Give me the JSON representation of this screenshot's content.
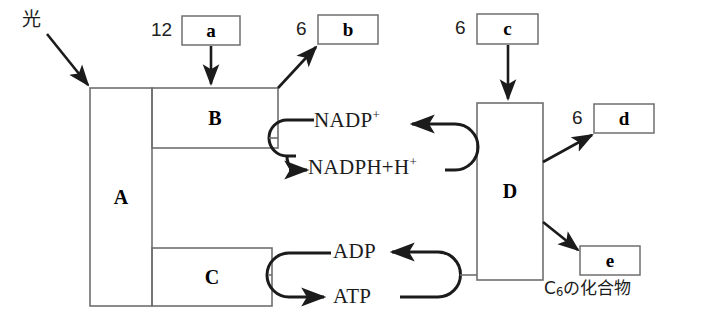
{
  "figure": {
    "background_color": "#ffffff",
    "line_color": "#333333",
    "arrow_color": "#1b1b1b"
  },
  "light": {
    "label": "光"
  },
  "process_boxes": [
    {
      "id": "A",
      "label": "A"
    },
    {
      "id": "B",
      "label": "B"
    },
    {
      "id": "C",
      "label": "C"
    },
    {
      "id": "D",
      "label": "D"
    }
  ],
  "substance_boxes": [
    {
      "id": "a",
      "label": "a",
      "coefficient": "12"
    },
    {
      "id": "b",
      "label": "b",
      "coefficient": "6"
    },
    {
      "id": "c",
      "label": "c",
      "coefficient": "6"
    },
    {
      "id": "d",
      "label": "d",
      "coefficient": "6"
    },
    {
      "id": "e",
      "label": "e",
      "coefficient": ""
    }
  ],
  "cycles": [
    {
      "id": "nadp-cycle",
      "top_label": "NADP",
      "top_superscript": "+",
      "bottom_label": "NADPH+H",
      "bottom_superscript": "+"
    },
    {
      "id": "atp-cycle",
      "top_label": "ADP",
      "top_superscript": "",
      "bottom_label": "ATP",
      "bottom_superscript": ""
    }
  ],
  "annotations": {
    "c6_compound_prefix": "C",
    "c6_compound_subscript": "6",
    "c6_compound_suffix": "の化合物"
  }
}
